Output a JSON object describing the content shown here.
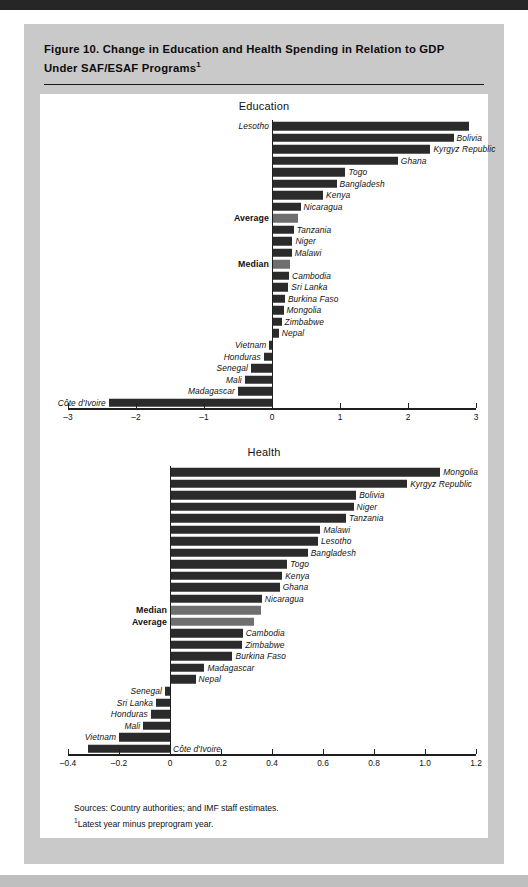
{
  "figure": {
    "title_line1": "Figure 10.  Change in Education and Health Spending in Relation to GDP",
    "title_line2": "Under SAF/ESAF Programs",
    "title_footnote_marker": "1",
    "sources_line": "Sources:  Country authorities; and IMF staff estimates.",
    "footnote_marker": "1",
    "footnote_line": "Latest year minus preprogram year."
  },
  "colors": {
    "bar_dark": "#2b2b2b",
    "bar_gray": "#6f6f6f",
    "card_background": "#c9c9c9",
    "plot_background": "#ffffff",
    "axis": "#1f1f1f",
    "text": "#111111"
  },
  "chart_data": [
    {
      "type": "bar",
      "orientation": "horizontal",
      "title": "Education",
      "xlabel": "",
      "ylabel": "",
      "xlim": [
        -3,
        3
      ],
      "xticks": [
        -3,
        -2,
        -1,
        0,
        1,
        2,
        3
      ],
      "xticklabels": [
        "–3",
        "–2",
        "–1",
        "0",
        "1",
        "2",
        "3"
      ],
      "grid": false,
      "legend": null,
      "categories": [
        "Lesotho",
        "Bolivia",
        "Kyrgyz Republic",
        "Ghana",
        "Togo",
        "Bangladesh",
        "Kenya",
        "Nicaragua",
        "Average",
        "Tanzania",
        "Niger",
        "Malawi",
        "Median",
        "Cambodia",
        "Sri Lanka",
        "Burkina Faso",
        "Mongolia",
        "Zimbabwe",
        "Nepal",
        "Vietnam",
        "Honduras",
        "Senegal",
        "Mali",
        "Madagascar",
        "Côte d'Ivoire"
      ],
      "values": [
        2.9,
        2.67,
        2.33,
        1.85,
        1.08,
        0.95,
        0.75,
        0.42,
        0.38,
        0.32,
        0.3,
        0.29,
        0.27,
        0.25,
        0.24,
        0.19,
        0.17,
        0.14,
        0.1,
        -0.04,
        -0.12,
        -0.31,
        -0.4,
        -0.5,
        -2.4
      ],
      "bar_styles": [
        "dark",
        "dark",
        "dark",
        "dark",
        "dark",
        "dark",
        "dark",
        "dark",
        "gray",
        "dark",
        "dark",
        "dark",
        "gray",
        "dark",
        "dark",
        "dark",
        "dark",
        "dark",
        "dark",
        "dark",
        "dark",
        "dark",
        "dark",
        "dark",
        "dark"
      ],
      "label_sides": [
        "left",
        "right",
        "right",
        "right",
        "right",
        "right",
        "right",
        "right",
        "left",
        "right",
        "right",
        "right",
        "left",
        "right",
        "right",
        "right",
        "right",
        "right",
        "right",
        "left",
        "left",
        "left",
        "left",
        "left",
        "left"
      ]
    },
    {
      "type": "bar",
      "orientation": "horizontal",
      "title": "Health",
      "xlabel": "",
      "ylabel": "",
      "xlim": [
        -0.4,
        1.2
      ],
      "xticks": [
        -0.4,
        -0.2,
        0,
        0.2,
        0.4,
        0.6,
        0.8,
        1.0,
        1.2
      ],
      "xticklabels": [
        "–0.4",
        "–0.2",
        "0",
        "0.2",
        "0.4",
        "0.6",
        "0.8",
        "1.0",
        "1.2"
      ],
      "grid": false,
      "legend": null,
      "categories": [
        "Mongolia",
        "Kyrgyz Republic",
        "Bolivia",
        "Niger",
        "Tanzania",
        "Malawi",
        "Lesotho",
        "Bangladesh",
        "Togo",
        "Kenya",
        "Ghana",
        "Nicaragua",
        "Median",
        "Average",
        "Cambodia",
        "Zimbabwe",
        "Burkina Faso",
        "Madagascar",
        "Nepal",
        "Senegal",
        "Sri Lanka",
        "Honduras",
        "Mali",
        "Vietnam",
        "Côte d'Ivoire"
      ],
      "values": [
        1.06,
        0.93,
        0.73,
        0.72,
        0.69,
        0.59,
        0.58,
        0.54,
        0.46,
        0.44,
        0.43,
        0.36,
        0.355,
        0.33,
        0.285,
        0.283,
        0.245,
        0.135,
        0.1,
        -0.02,
        -0.055,
        -0.075,
        -0.105,
        -0.2,
        -0.32
      ],
      "bar_styles": [
        "dark",
        "dark",
        "dark",
        "dark",
        "dark",
        "dark",
        "dark",
        "dark",
        "dark",
        "dark",
        "dark",
        "dark",
        "gray",
        "gray",
        "dark",
        "dark",
        "dark",
        "dark",
        "dark",
        "dark",
        "dark",
        "dark",
        "dark",
        "dark",
        "dark"
      ],
      "label_sides": [
        "right",
        "right",
        "right",
        "right",
        "right",
        "right",
        "right",
        "right",
        "right",
        "right",
        "right",
        "right",
        "left",
        "left",
        "right",
        "right",
        "right",
        "right",
        "right",
        "left",
        "left",
        "left",
        "left",
        "left",
        "right"
      ]
    }
  ]
}
